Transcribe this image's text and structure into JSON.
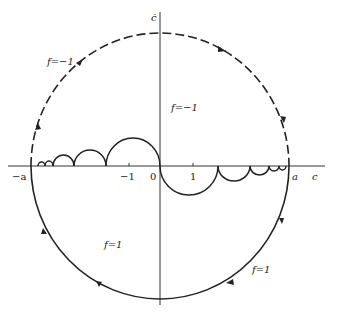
{
  "figure": {
    "axes": {
      "x_label": "c",
      "y_label": "ċ",
      "x_ticks": [
        {
          "value": "-a",
          "label": "−a"
        },
        {
          "value": "-1",
          "label": "−1"
        },
        {
          "value": "0",
          "label": "0"
        },
        {
          "value": "1",
          "label": "1"
        },
        {
          "value": "a",
          "label": "a"
        }
      ]
    },
    "regions": [
      {
        "id": "upper-arc",
        "label": "f = −1",
        "style": "dashed"
      },
      {
        "id": "upper-interior",
        "label": "f = −1"
      },
      {
        "id": "lower-interior",
        "label": "f = 1"
      },
      {
        "id": "lower-arc",
        "label": "f = 1",
        "style": "solid"
      }
    ],
    "labels": {
      "upper_arc": "f=−1",
      "upper_interior": "f=−1",
      "lower_interior": "f=1",
      "lower_arc": "f=1",
      "x_axis": "c",
      "y_axis": "ċ",
      "neg_a": "−a",
      "neg_one": "−1",
      "zero": "0",
      "one": "1",
      "a": "a"
    }
  }
}
